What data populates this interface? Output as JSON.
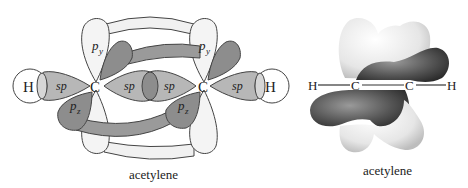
{
  "left_diagram": {
    "caption": "acetylene",
    "atoms": {
      "h_left": "H",
      "c_left": "C",
      "c_right": "C",
      "h_right": "H"
    },
    "orbital_labels": {
      "sp": "sp",
      "p_main": "p",
      "sub_y": "y",
      "sub_z": "z"
    }
  },
  "right_diagram": {
    "caption": "acetylene",
    "atoms": {
      "h_left": "H",
      "c_left": "C",
      "c_right": "C",
      "h_right": "H"
    }
  },
  "colors": {
    "light_lobe": "#f3f3f3",
    "mid_lobe": "#b5b5b5",
    "dark_lobe": "#8a8a8a",
    "outline": "#444444"
  }
}
